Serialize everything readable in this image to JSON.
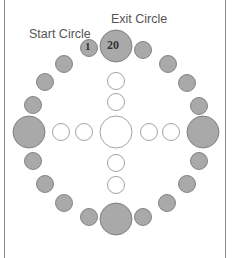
{
  "labels": {
    "start_circle": "Start Circle",
    "exit_circle": "Exit Circle"
  },
  "numbers": {
    "start": "1",
    "exit": "20"
  },
  "caption": "Circle placement diagram",
  "colors": {
    "filled": "#a9a9a9",
    "stroke": "#6f6f6f",
    "hollow_stroke": "#8c8c8c",
    "background": "#ffffff"
  }
}
